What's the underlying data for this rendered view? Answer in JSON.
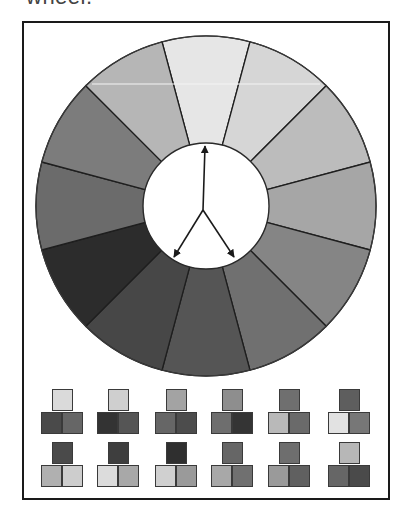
{
  "caption": "wheel.",
  "wheel": {
    "center": [
      206,
      206
    ],
    "outer_radius": 170,
    "inner_radius": 63,
    "segment_count": 12,
    "segments": [
      {
        "angle": -90,
        "color": "#e6e6e6"
      },
      {
        "angle": -60,
        "color": "#d6d6d6"
      },
      {
        "angle": -30,
        "color": "#bcbcbc"
      },
      {
        "angle": 0,
        "color": "#a6a6a6"
      },
      {
        "angle": 30,
        "color": "#858585"
      },
      {
        "angle": 60,
        "color": "#707070"
      },
      {
        "angle": 90,
        "color": "#555555"
      },
      {
        "angle": 120,
        "color": "#474747"
      },
      {
        "angle": 150,
        "color": "#2c2c2c"
      },
      {
        "angle": 180,
        "color": "#6b6b6b"
      },
      {
        "angle": 210,
        "color": "#7c7c7c"
      },
      {
        "angle": 240,
        "color": "#b6b6b6"
      }
    ],
    "arrows": {
      "origin": [
        203,
        210
      ],
      "targets": [
        [
          205,
          146
        ],
        [
          174,
          257
        ],
        [
          234,
          257
        ]
      ]
    }
  },
  "swatches": {
    "rows": [
      [
        {
          "top": "#dadada",
          "left": "#4a4a4a",
          "right": "#666666"
        },
        {
          "top": "#cfcfcf",
          "left": "#333333",
          "right": "#555555"
        },
        {
          "top": "#a3a3a3",
          "left": "#666666",
          "right": "#4c4c4c"
        },
        {
          "top": "#8e8e8e",
          "left": "#6e6e6e",
          "right": "#343434"
        },
        {
          "top": "#6f6f6f",
          "left": "#b9b9b9",
          "right": "#6a6a6a"
        },
        {
          "top": "#5e5e5e",
          "left": "#e2e2e2",
          "right": "#777777"
        }
      ],
      [
        {
          "top": "#4a4a4a",
          "left": "#b0b0b0",
          "right": "#cdcdcd"
        },
        {
          "top": "#3e3e3e",
          "left": "#dcdcdc",
          "right": "#a8a8a8"
        },
        {
          "top": "#2f2f2f",
          "left": "#d0d0d0",
          "right": "#9a9a9a"
        },
        {
          "top": "#666666",
          "left": "#a8a8a8",
          "right": "#707070"
        },
        {
          "top": "#6e6e6e",
          "left": "#9a9a9a",
          "right": "#606060"
        },
        {
          "top": "#b7b7b7",
          "left": "#666666",
          "right": "#4a4a4a"
        }
      ]
    ],
    "group_x": [
      41,
      97,
      155,
      211,
      268,
      328
    ],
    "row_y": [
      389,
      442
    ]
  }
}
